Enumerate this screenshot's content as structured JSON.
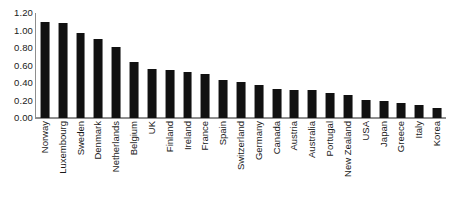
{
  "chart_data": {
    "type": "bar",
    "title": "",
    "xlabel": "",
    "ylabel": "",
    "ylim": [
      0.0,
      1.2
    ],
    "ytick_labels": [
      "1.20",
      "1.00",
      "0.80",
      "0.60",
      "0.40",
      "0.20",
      "0.00"
    ],
    "ytick_values": [
      1.2,
      1.0,
      0.8,
      0.6,
      0.4,
      0.2,
      0.0
    ],
    "grid": false,
    "legend": "none",
    "bar_color": "#111111",
    "axis_color": "#8e8e8e",
    "categories": [
      "Norway",
      "Luxembourg",
      "Sweden",
      "Denmark",
      "Netherlands",
      "Belgium",
      "UK",
      "Finland",
      "Ireland",
      "France",
      "Spain",
      "Switzerland",
      "Germany",
      "Canada",
      "Austria",
      "Australia",
      "Portugal",
      "New Zealand",
      "USA",
      "Japan",
      "Greece",
      "Italy",
      "Korea"
    ],
    "values": [
      1.1,
      1.09,
      0.97,
      0.9,
      0.81,
      0.64,
      0.56,
      0.55,
      0.53,
      0.5,
      0.43,
      0.41,
      0.38,
      0.33,
      0.32,
      0.32,
      0.29,
      0.26,
      0.21,
      0.2,
      0.17,
      0.15,
      0.12
    ]
  }
}
